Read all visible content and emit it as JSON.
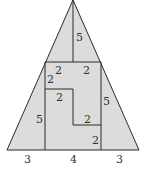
{
  "diagram": {
    "colors": {
      "fill": "#dcdcdc",
      "stroke": "#2a2a2a",
      "text": "#333333",
      "background": "#ffffff"
    },
    "labels": {
      "apex_vertical": "5",
      "top_left_horizontal": "2",
      "top_right_horizontal": "2",
      "left_upper_vertical": "2",
      "inner_horizontal": "2",
      "right_vertical": "5",
      "left_vertical": "5",
      "step_horizontal": "2",
      "step_vertical": "2",
      "base_left": "3",
      "base_middle": "4",
      "base_right": "3"
    }
  }
}
